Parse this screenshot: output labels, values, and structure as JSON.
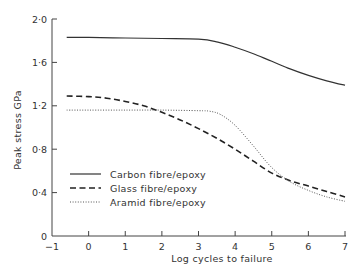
{
  "chart_data": {
    "type": "line",
    "title": "",
    "xlabel": "Log cycles to failure",
    "ylabel": "Peak stress GPa",
    "xlim": [
      -1,
      7
    ],
    "ylim": [
      0,
      2.0
    ],
    "xticks": [
      -1,
      0,
      1,
      2,
      3,
      4,
      5,
      6,
      7
    ],
    "xtick_labels": [
      "−1",
      "0",
      "1",
      "2",
      "3",
      "4",
      "5",
      "6",
      "7"
    ],
    "yticks": [
      0,
      0.4,
      0.8,
      1.2,
      1.6,
      2.0
    ],
    "ytick_labels": [
      "0",
      "0·4",
      "0·8",
      "1·2",
      "1·6",
      "2·0"
    ],
    "grid": false,
    "legend_position": "lower-left",
    "series": [
      {
        "name": "Carbon fibre/epoxy",
        "style": "solid",
        "color": "#333333",
        "x": [
          -0.6,
          0,
          1,
          2,
          3,
          3.5,
          4,
          4.5,
          5,
          5.5,
          6,
          6.5,
          7
        ],
        "y": [
          1.83,
          1.83,
          1.825,
          1.82,
          1.815,
          1.79,
          1.74,
          1.68,
          1.61,
          1.54,
          1.48,
          1.43,
          1.39
        ]
      },
      {
        "name": "Glass fibre/epoxy",
        "style": "dashed",
        "color": "#222222",
        "x": [
          -0.6,
          0,
          0.5,
          1,
          1.5,
          2,
          2.5,
          3,
          3.5,
          4,
          4.5,
          5,
          5.5,
          6,
          6.5,
          7
        ],
        "y": [
          1.29,
          1.285,
          1.27,
          1.24,
          1.2,
          1.14,
          1.07,
          0.99,
          0.9,
          0.8,
          0.69,
          0.58,
          0.51,
          0.46,
          0.41,
          0.36
        ]
      },
      {
        "name": "Aramid fibre/epoxy",
        "style": "dotted",
        "color": "#555555",
        "x": [
          -0.6,
          0,
          1,
          2,
          3,
          3.3,
          3.6,
          4,
          4.5,
          5,
          5.5,
          6,
          6.5,
          7
        ],
        "y": [
          1.16,
          1.16,
          1.16,
          1.16,
          1.155,
          1.15,
          1.12,
          1.02,
          0.83,
          0.63,
          0.5,
          0.42,
          0.36,
          0.32
        ]
      }
    ]
  }
}
